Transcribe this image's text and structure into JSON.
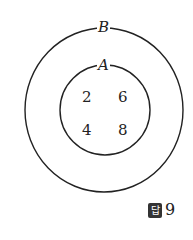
{
  "diagram": {
    "type": "venn",
    "sets": [
      {
        "name": "B",
        "label": "B",
        "contains": [
          "A"
        ]
      },
      {
        "name": "A",
        "label": "A",
        "elements": [
          "2",
          "6",
          "4",
          "8"
        ]
      }
    ],
    "outer_label": "B",
    "inner_label": "A",
    "elements": [
      "2",
      "6",
      "4",
      "8"
    ]
  },
  "answer": {
    "badge": "답",
    "value": "9"
  }
}
